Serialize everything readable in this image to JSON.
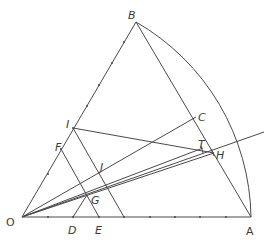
{
  "diagram": {
    "type": "geometric-construction",
    "points": {
      "O": {
        "label": "O",
        "x": 22,
        "y": 217
      },
      "A": {
        "label": "A",
        "x": 251,
        "y": 217
      },
      "B": {
        "label": "B",
        "x": 136,
        "y": 22
      },
      "C": {
        "label": "C",
        "x": 196,
        "y": 117
      },
      "I": {
        "label": "I",
        "x": 73,
        "y": 128
      },
      "F": {
        "label": "F",
        "x": 61,
        "y": 149
      },
      "D": {
        "label": "D",
        "x": 73,
        "y": 217
      },
      "E": {
        "label": "E",
        "x": 99,
        "y": 217
      },
      "G": {
        "label": "G",
        "x": 87,
        "y": 195
      },
      "J": {
        "label": "J",
        "x": 99,
        "y": 174
      },
      "T": {
        "label": "T",
        "x": 202,
        "y": 150
      },
      "H": {
        "label": "H",
        "x": 212,
        "y": 153
      }
    },
    "labels": {
      "O": "O",
      "A": "A",
      "B": "B",
      "C": "C",
      "I": "I",
      "F": "F",
      "D": "D",
      "E": "E",
      "G": "G",
      "J": "J",
      "T": "T",
      "H": "H"
    },
    "segments": [
      "OA",
      "OB",
      "BA-arc",
      "BC-to-A",
      "OC",
      "IH",
      "IJ",
      "FE",
      "DG",
      "OT",
      "OH",
      "O-extended-ray"
    ],
    "stroke_color": "#4a4a4a",
    "background": "#ffffff"
  }
}
